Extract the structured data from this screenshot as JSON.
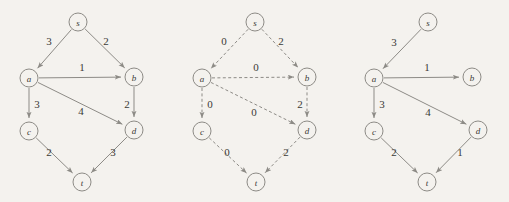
{
  "figure": {
    "background_color": "#f4f2ee",
    "node_stroke_color": "#8d8b86",
    "edge_stroke_color": "#8d8b86",
    "label_color": "#3b3a37",
    "node_radius": 9
  },
  "graphs": [
    {
      "id": "graph-left",
      "style": "solid",
      "nodes": [
        {
          "id": "s",
          "label": "s",
          "x": 78,
          "y": 22
        },
        {
          "id": "a",
          "label": "a",
          "x": 29,
          "y": 78
        },
        {
          "id": "b",
          "label": "b",
          "x": 134,
          "y": 77
        },
        {
          "id": "c",
          "label": "c",
          "x": 29,
          "y": 131
        },
        {
          "id": "d",
          "label": "d",
          "x": 134,
          "y": 130
        },
        {
          "id": "t",
          "label": "t",
          "x": 82,
          "y": 182
        }
      ],
      "edges": [
        {
          "from": "s",
          "to": "a",
          "weight": "3",
          "lx": 49,
          "ly": 41
        },
        {
          "from": "s",
          "to": "b",
          "weight": "2",
          "lx": 106,
          "ly": 41
        },
        {
          "from": "a",
          "to": "b",
          "weight": "1",
          "lx": 82,
          "ly": 67
        },
        {
          "from": "a",
          "to": "c",
          "weight": "3",
          "lx": 37,
          "ly": 104
        },
        {
          "from": "a",
          "to": "d",
          "weight": "4",
          "lx": 81,
          "ly": 111
        },
        {
          "from": "b",
          "to": "d",
          "weight": "2",
          "lx": 127,
          "ly": 104
        },
        {
          "from": "c",
          "to": "t",
          "weight": "2",
          "lx": 49,
          "ly": 152
        },
        {
          "from": "d",
          "to": "t",
          "weight": "3",
          "lx": 113,
          "ly": 152
        }
      ]
    },
    {
      "id": "graph-middle",
      "style": "dashed",
      "nodes": [
        {
          "id": "s",
          "label": "s",
          "x": 255,
          "y": 22
        },
        {
          "id": "a",
          "label": "a",
          "x": 202,
          "y": 78
        },
        {
          "id": "b",
          "label": "b",
          "x": 307,
          "y": 77
        },
        {
          "id": "c",
          "label": "c",
          "x": 202,
          "y": 131
        },
        {
          "id": "d",
          "label": "d",
          "x": 307,
          "y": 130
        },
        {
          "id": "t",
          "label": "t",
          "x": 256,
          "y": 182
        }
      ],
      "edges": [
        {
          "from": "s",
          "to": "a",
          "weight": "0",
          "lx": 224,
          "ly": 41
        },
        {
          "from": "s",
          "to": "b",
          "weight": "2",
          "lx": 281,
          "ly": 41
        },
        {
          "from": "a",
          "to": "b",
          "weight": "0",
          "lx": 256,
          "ly": 67
        },
        {
          "from": "a",
          "to": "c",
          "weight": "0",
          "lx": 210,
          "ly": 104
        },
        {
          "from": "a",
          "to": "d",
          "weight": "0",
          "lx": 254,
          "ly": 112
        },
        {
          "from": "b",
          "to": "d",
          "weight": "2",
          "lx": 300,
          "ly": 104
        },
        {
          "from": "c",
          "to": "t",
          "weight": "0",
          "lx": 227,
          "ly": 152
        },
        {
          "from": "d",
          "to": "t",
          "weight": "2",
          "lx": 286,
          "ly": 152
        }
      ]
    },
    {
      "id": "graph-right",
      "style": "solid",
      "nodes": [
        {
          "id": "s",
          "label": "s",
          "x": 428,
          "y": 22
        },
        {
          "id": "a",
          "label": "a",
          "x": 374,
          "y": 78
        },
        {
          "id": "b",
          "label": "b",
          "x": 472,
          "y": 77
        },
        {
          "id": "c",
          "label": "c",
          "x": 374,
          "y": 131
        },
        {
          "id": "d",
          "label": "d",
          "x": 478,
          "y": 130
        },
        {
          "id": "t",
          "label": "t",
          "x": 427,
          "y": 182
        }
      ],
      "edges": [
        {
          "from": "s",
          "to": "a",
          "weight": "3",
          "lx": 394,
          "ly": 42
        },
        {
          "from": "a",
          "to": "b",
          "weight": "1",
          "lx": 427,
          "ly": 67
        },
        {
          "from": "a",
          "to": "c",
          "weight": "3",
          "lx": 382,
          "ly": 104
        },
        {
          "from": "a",
          "to": "d",
          "weight": "4",
          "lx": 428,
          "ly": 112
        },
        {
          "from": "c",
          "to": "t",
          "weight": "2",
          "lx": 394,
          "ly": 152
        },
        {
          "from": "d",
          "to": "t",
          "weight": "1",
          "lx": 460,
          "ly": 152
        }
      ]
    }
  ]
}
